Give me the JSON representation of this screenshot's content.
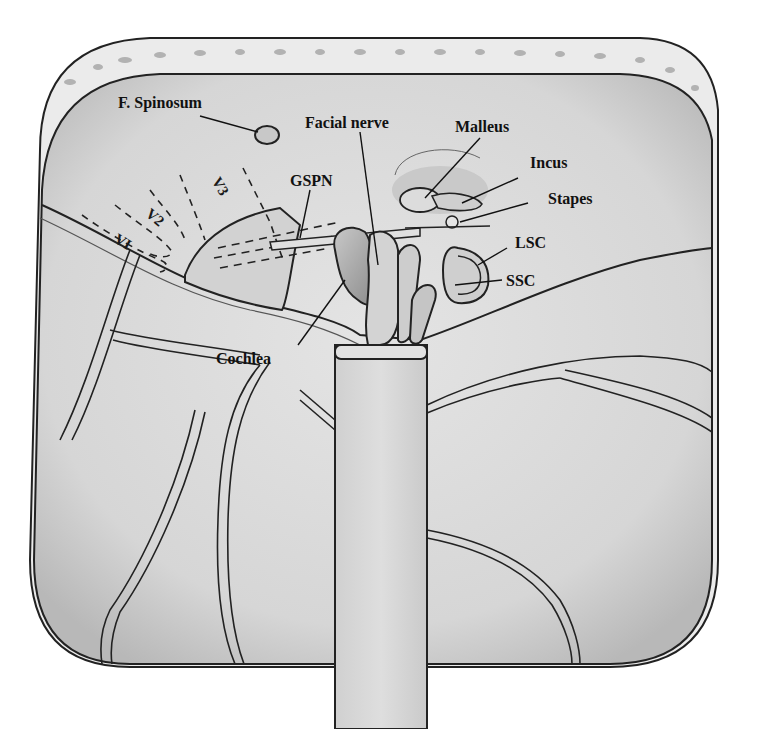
{
  "figure": {
    "type": "anatomical-illustration",
    "colors": {
      "background": "#ffffff",
      "field": "#d9d9d9",
      "field_light": "#e6e6e6",
      "bone_rim": "#e8e8e8",
      "outline": "#222222",
      "label_text": "#111111"
    }
  },
  "labels": {
    "f_spinosum": "F. Spinosum",
    "facial_nerve": "Facial nerve",
    "malleus": "Malleus",
    "incus": "Incus",
    "stapes": "Stapes",
    "gspn": "GSPN",
    "lsc": "LSC",
    "ssc": "SSC",
    "cochlea": "Cochlea",
    "v3": "V3",
    "v2": "V2",
    "v1": "VI"
  }
}
